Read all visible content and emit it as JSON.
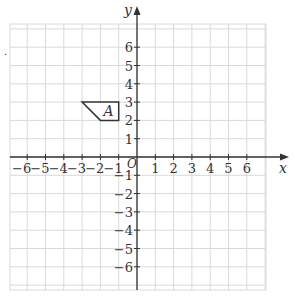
{
  "figure": {
    "type": "coordinate-grid",
    "x_axis_label": "x",
    "y_axis_label": "y",
    "origin_label": "O",
    "x_range": [
      -7,
      7
    ],
    "y_range": [
      -7,
      7
    ],
    "x_tick_labels": [
      "−6",
      "−5",
      "−4",
      "−3",
      "−2",
      "−1",
      "1",
      "2",
      "3",
      "4",
      "5",
      "6"
    ],
    "y_tick_labels": [
      "6",
      "5",
      "4",
      "3",
      "2",
      "1",
      "−1",
      "−2",
      "−3",
      "−4",
      "−5",
      "−6"
    ],
    "grid_color": "#d9d9d9",
    "axis_color": "#333333",
    "shapes": [
      {
        "label": "A",
        "vertices": [
          [
            -3,
            3
          ],
          [
            -1,
            3
          ],
          [
            -1,
            2
          ],
          [
            -2,
            2
          ]
        ],
        "stroke": "#333333"
      }
    ],
    "stray_mark": "."
  }
}
